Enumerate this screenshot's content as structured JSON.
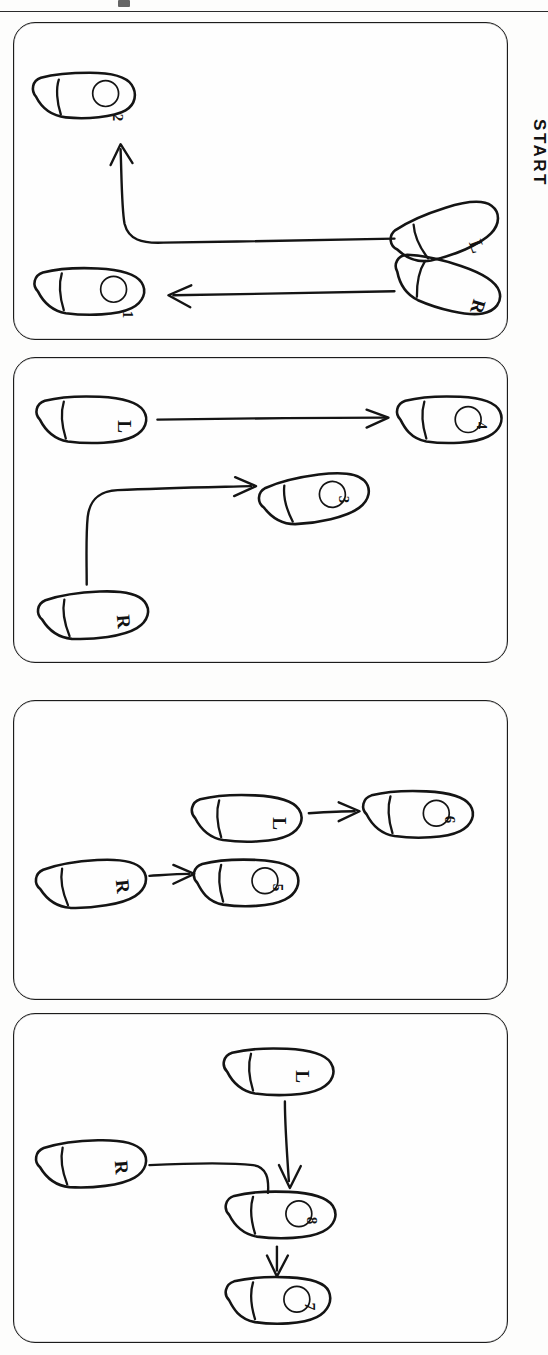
{
  "page": {
    "orientation": "rotated-90-clockwise",
    "top_rule": true,
    "background_color": "#fdfdfc",
    "ink_color": "#141414"
  },
  "annotations": {
    "start_label": "START"
  },
  "legend": {
    "left_foot": "L",
    "right_foot": "R"
  },
  "panels": [
    {
      "id": "panel-1",
      "index": "1",
      "feet": [
        {
          "name": "start-left-foot",
          "label": "L",
          "kind": "letter",
          "x": 452,
          "y": 225,
          "rot": -22
        },
        {
          "name": "start-right-foot",
          "label": "R",
          "kind": "letter",
          "x": 452,
          "y": 278,
          "rot": 18
        },
        {
          "name": "target-foot-2",
          "label": "2",
          "kind": "number",
          "x": 78,
          "y": 90,
          "rot": -6
        },
        {
          "name": "target-foot-1",
          "label": "1",
          "kind": "number",
          "x": 84,
          "y": 280,
          "rot": 4
        }
      ],
      "paths": [
        {
          "name": "left-foot-path",
          "from": "L",
          "to": "2",
          "shape": "elbow-left-then-up"
        },
        {
          "name": "right-foot-path",
          "from": "R",
          "to": "1",
          "shape": "straight-left"
        }
      ]
    },
    {
      "id": "panel-2",
      "index": "2",
      "feet": [
        {
          "name": "left-foot",
          "label": "L",
          "kind": "letter",
          "x": 96,
          "y": 417,
          "rot": 0
        },
        {
          "name": "target-foot-4",
          "label": "4",
          "kind": "number",
          "x": 458,
          "y": 418,
          "rot": 0
        },
        {
          "name": "target-foot-3",
          "label": "3",
          "kind": "number",
          "x": 314,
          "y": 494,
          "rot": -10
        },
        {
          "name": "right-foot",
          "label": "R",
          "kind": "letter",
          "x": 93,
          "y": 612,
          "rot": -5
        }
      ],
      "paths": [
        {
          "name": "left-foot-path",
          "from": "L",
          "to": "4",
          "shape": "straight-right"
        },
        {
          "name": "right-foot-path",
          "from": "R",
          "to": "3",
          "shape": "up-then-right"
        }
      ]
    },
    {
      "id": "panel-3",
      "index": "3",
      "feet": [
        {
          "name": "left-foot",
          "label": "L",
          "kind": "letter",
          "x": 254,
          "y": 818,
          "rot": 0
        },
        {
          "name": "target-foot-6",
          "label": "6",
          "kind": "number",
          "x": 448,
          "y": 812,
          "rot": 0
        },
        {
          "name": "right-foot",
          "label": "R",
          "kind": "letter",
          "x": 72,
          "y": 880,
          "rot": -6
        },
        {
          "name": "target-foot-5",
          "label": "5",
          "kind": "number",
          "x": 256,
          "y": 879,
          "rot": 0
        }
      ],
      "paths": [
        {
          "name": "left-foot-path",
          "from": "L",
          "to": "6",
          "shape": "straight-right"
        },
        {
          "name": "right-foot-path",
          "from": "R",
          "to": "5",
          "shape": "straight-right"
        }
      ]
    },
    {
      "id": "panel-4",
      "index": "4",
      "feet": [
        {
          "name": "left-foot",
          "label": "L",
          "kind": "letter",
          "x": 288,
          "y": 1087,
          "rot": 0
        },
        {
          "name": "right-foot",
          "label": "R",
          "kind": "letter",
          "x": 72,
          "y": 1147,
          "rot": -4
        },
        {
          "name": "target-foot-8",
          "label": "8",
          "kind": "number",
          "x": 288,
          "y": 1203,
          "rot": 0
        },
        {
          "name": "target-foot-7",
          "label": "7",
          "kind": "number",
          "x": 288,
          "y": 1288,
          "rot": 0
        }
      ],
      "paths": [
        {
          "name": "left-foot-path",
          "from": "L",
          "to": "8",
          "shape": "straight-down"
        },
        {
          "name": "right-foot-path",
          "from": "R",
          "to": "8",
          "shape": "right-then-curve-down"
        },
        {
          "name": "step-path-8-to-7",
          "from": "8",
          "to": "7",
          "shape": "straight-down"
        }
      ]
    }
  ]
}
